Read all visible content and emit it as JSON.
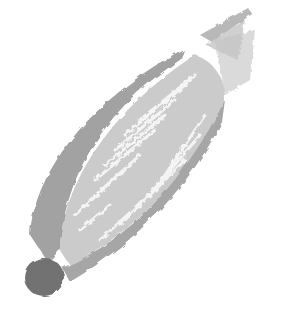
{
  "image": {
    "subject": "corn cob illustration",
    "style": "grayscale brush painting",
    "width": 282,
    "height": 318
  },
  "colors": {
    "background": "#ffffff",
    "husk": "#a2a2a2",
    "husk_light": "#b4b4b4",
    "kernels": "#cbcbcb",
    "kernel_gap": "#f2f2f2",
    "stem": "#727272",
    "silk": "#c2c2c2"
  }
}
